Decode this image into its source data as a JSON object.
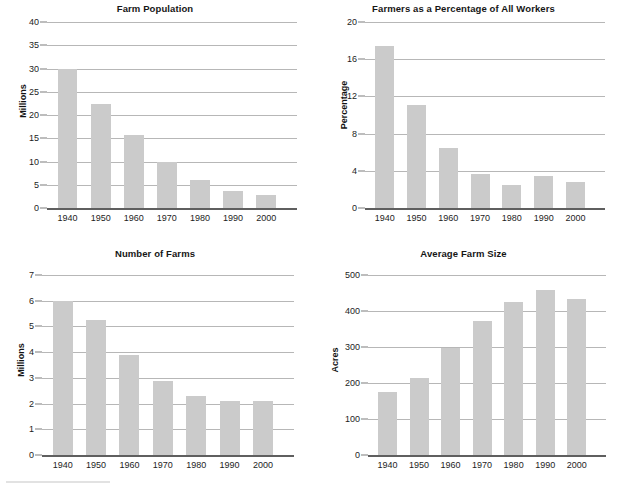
{
  "page": {
    "background": "#ffffff",
    "bar_color": "#cbcbcb",
    "gridline_color": "#b7b7b7",
    "axis_color": "#5f5f5f",
    "text_color": "#1d1d1d"
  },
  "charts": [
    {
      "id": "farm-population",
      "title": "Farm Population",
      "ylabel": "Millions",
      "xlabel": "",
      "type": "bar",
      "categories": [
        "1940",
        "1950",
        "1960",
        "1970",
        "1980",
        "1990",
        "2000"
      ],
      "values": [
        30.0,
        22.3,
        15.7,
        9.9,
        6.0,
        3.7,
        2.8
      ],
      "yticks": [
        0,
        5,
        10,
        15,
        20,
        25,
        30,
        35,
        40
      ],
      "ytick_labels": [
        "0",
        "5",
        "10",
        "15",
        "20",
        "25",
        "30",
        "35",
        "40"
      ],
      "ylim": [
        0,
        40
      ],
      "grid": true,
      "legend": "none"
    },
    {
      "id": "farmers-percentage",
      "title": "Farmers as a Percentage of All Workers",
      "ylabel": "Percentage",
      "xlabel": "",
      "type": "bar",
      "categories": [
        "1940",
        "1950",
        "1960",
        "1970",
        "1980",
        "1990",
        "2000"
      ],
      "values": [
        17.4,
        11.1,
        6.4,
        3.7,
        2.5,
        3.4,
        2.8
      ],
      "yticks": [
        0,
        4,
        8,
        12,
        16,
        20
      ],
      "ytick_labels": [
        "0",
        "4",
        "8",
        "12",
        "16",
        "20"
      ],
      "ylim": [
        0,
        20
      ],
      "grid": true,
      "legend": "none"
    },
    {
      "id": "number-of-farms",
      "title": "Number of Farms",
      "ylabel": "Millions",
      "xlabel": "",
      "type": "bar",
      "categories": [
        "1940",
        "1950",
        "1960",
        "1970",
        "1980",
        "1990",
        "2000"
      ],
      "values": [
        6.0,
        5.25,
        3.9,
        2.88,
        2.3,
        2.1,
        2.1
      ],
      "yticks": [
        0,
        1,
        2,
        3,
        4,
        5,
        6,
        7
      ],
      "ytick_labels": [
        "0",
        "1",
        "2",
        "3",
        "4",
        "5",
        "6",
        "7"
      ],
      "ylim": [
        0,
        7
      ],
      "grid": true,
      "legend": "none"
    },
    {
      "id": "average-farm-size",
      "title": "Average Farm Size",
      "ylabel": "Acres",
      "xlabel": "",
      "type": "bar",
      "categories": [
        "1940",
        "1950",
        "1960",
        "1970",
        "1980",
        "1990",
        "2000"
      ],
      "values": [
        175,
        215,
        297,
        373,
        425,
        458,
        432
      ],
      "yticks": [
        0,
        100,
        200,
        300,
        400,
        500
      ],
      "ytick_labels": [
        "0",
        "100",
        "200",
        "300",
        "400",
        "500"
      ],
      "ylim": [
        0,
        500
      ],
      "grid": true,
      "legend": "none"
    }
  ],
  "chart_data": [
    {
      "type": "bar",
      "title": "Farm Population",
      "xlabel": "",
      "ylabel": "Millions",
      "categories": [
        "1940",
        "1950",
        "1960",
        "1970",
        "1980",
        "1990",
        "2000"
      ],
      "values": [
        30.0,
        22.3,
        15.7,
        9.9,
        6.0,
        3.7,
        2.8
      ],
      "ylim": [
        0,
        40
      ],
      "yticks": [
        0,
        5,
        10,
        15,
        20,
        25,
        30,
        35,
        40
      ],
      "grid": true,
      "legend": "none"
    },
    {
      "type": "bar",
      "title": "Farmers as a Percentage of All Workers",
      "xlabel": "",
      "ylabel": "Percentage",
      "categories": [
        "1940",
        "1950",
        "1960",
        "1970",
        "1980",
        "1990",
        "2000"
      ],
      "values": [
        17.4,
        11.1,
        6.4,
        3.7,
        2.5,
        3.4,
        2.8
      ],
      "ylim": [
        0,
        20
      ],
      "yticks": [
        0,
        4,
        8,
        12,
        16,
        20
      ],
      "grid": true,
      "legend": "none"
    },
    {
      "type": "bar",
      "title": "Number of Farms",
      "xlabel": "",
      "ylabel": "Millions",
      "categories": [
        "1940",
        "1950",
        "1960",
        "1970",
        "1980",
        "1990",
        "2000"
      ],
      "values": [
        6.0,
        5.25,
        3.9,
        2.88,
        2.3,
        2.1,
        2.1
      ],
      "ylim": [
        0,
        7
      ],
      "yticks": [
        0,
        1,
        2,
        3,
        4,
        5,
        6,
        7
      ],
      "grid": true,
      "legend": "none"
    },
    {
      "type": "bar",
      "title": "Average Farm Size",
      "xlabel": "",
      "ylabel": "Acres",
      "categories": [
        "1940",
        "1950",
        "1960",
        "1970",
        "1980",
        "1990",
        "2000"
      ],
      "values": [
        175,
        215,
        297,
        373,
        425,
        458,
        432
      ],
      "ylim": [
        0,
        500
      ],
      "yticks": [
        0,
        100,
        200,
        300,
        400,
        500
      ],
      "grid": true,
      "legend": "none"
    }
  ]
}
